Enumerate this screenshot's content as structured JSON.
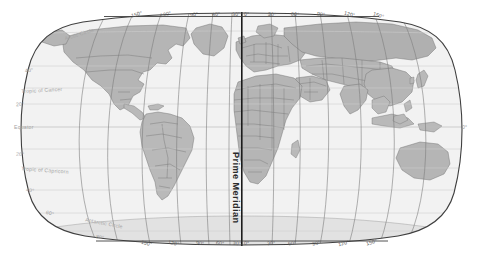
{
  "map": {
    "title": "World Map",
    "projection": "Robinson",
    "prime_meridian_label": "Prime Meridian",
    "colors": {
      "ocean": "#f2f2f2",
      "land": "#b9b9b9",
      "land_north": "#b0b0b0",
      "border": "#6a6a6a",
      "outline": "#4a4a4a",
      "graticule": "#8d8d8d",
      "parallel": "#cfcfcf",
      "prime_meridian": "#1c1c1c",
      "label_lon": "#5d5d5d",
      "label_lat": "#9b9b9b",
      "background": "#ffffff"
    },
    "longitude_labels_top": [
      {
        "text": "150°",
        "x": 131,
        "y": 11
      },
      {
        "text": "120°",
        "x": 160,
        "y": 11
      },
      {
        "text": "90°",
        "x": 189,
        "y": 11
      },
      {
        "text": "60°",
        "x": 212,
        "y": 11
      },
      {
        "text": "30°",
        "x": 233,
        "y": 11
      },
      {
        "text": "0°",
        "x": 243,
        "y": 11
      },
      {
        "text": "30°",
        "x": 270,
        "y": 11
      },
      {
        "text": "60°",
        "x": 292,
        "y": 11
      },
      {
        "text": "90°",
        "x": 318,
        "y": 11
      },
      {
        "text": "120°",
        "x": 345,
        "y": 11
      },
      {
        "text": "150°",
        "x": 374,
        "y": 11
      }
    ],
    "longitude_labels_bottom": [
      {
        "text": "150°",
        "x": 141,
        "y": 240
      },
      {
        "text": "120°",
        "x": 168,
        "y": 240
      },
      {
        "text": "90°",
        "x": 195,
        "y": 240
      },
      {
        "text": "60°",
        "x": 216,
        "y": 240
      },
      {
        "text": "30°",
        "x": 234,
        "y": 240
      },
      {
        "text": "0°",
        "x": 243,
        "y": 240
      },
      {
        "text": "30°",
        "x": 268,
        "y": 240
      },
      {
        "text": "60°",
        "x": 289,
        "y": 240
      },
      {
        "text": "90°",
        "x": 313,
        "y": 240
      },
      {
        "text": "120°",
        "x": 339,
        "y": 240
      },
      {
        "text": "150°",
        "x": 367,
        "y": 240
      }
    ],
    "latitude_labels": [
      {
        "text": "Arctic Circle",
        "x": 64,
        "y": 31,
        "kind": "named",
        "rot": -17
      },
      {
        "text": "40°",
        "x": 25,
        "y": 69,
        "kind": "deg",
        "rot": -9
      },
      {
        "text": "Tropic of Cancer",
        "x": 21,
        "y": 89,
        "kind": "named",
        "rot": -3
      },
      {
        "text": "20°",
        "x": 16,
        "y": 103,
        "kind": "deg",
        "rot": -2
      },
      {
        "text": "Equator",
        "x": 14,
        "y": 127,
        "kind": "named",
        "rot": 0
      },
      {
        "text": "20°",
        "x": 16,
        "y": 153,
        "kind": "deg",
        "rot": 2
      },
      {
        "text": "Tropic of Capricorn",
        "x": 21,
        "y": 170,
        "kind": "named",
        "rot": 4
      },
      {
        "text": "40°",
        "x": 26,
        "y": 189,
        "kind": "deg",
        "rot": 9
      },
      {
        "text": "60°",
        "x": 46,
        "y": 212,
        "kind": "deg",
        "rot": 16
      },
      {
        "text": "Antarctic Circle",
        "x": 85,
        "y": 222,
        "kind": "named",
        "rot": 11
      },
      {
        "text": "80°",
        "x": 96,
        "y": 236,
        "kind": "deg",
        "rot": 11
      },
      {
        "text": "0°",
        "x": 462,
        "y": 126,
        "kind": "deg",
        "rot": 0
      }
    ]
  }
}
